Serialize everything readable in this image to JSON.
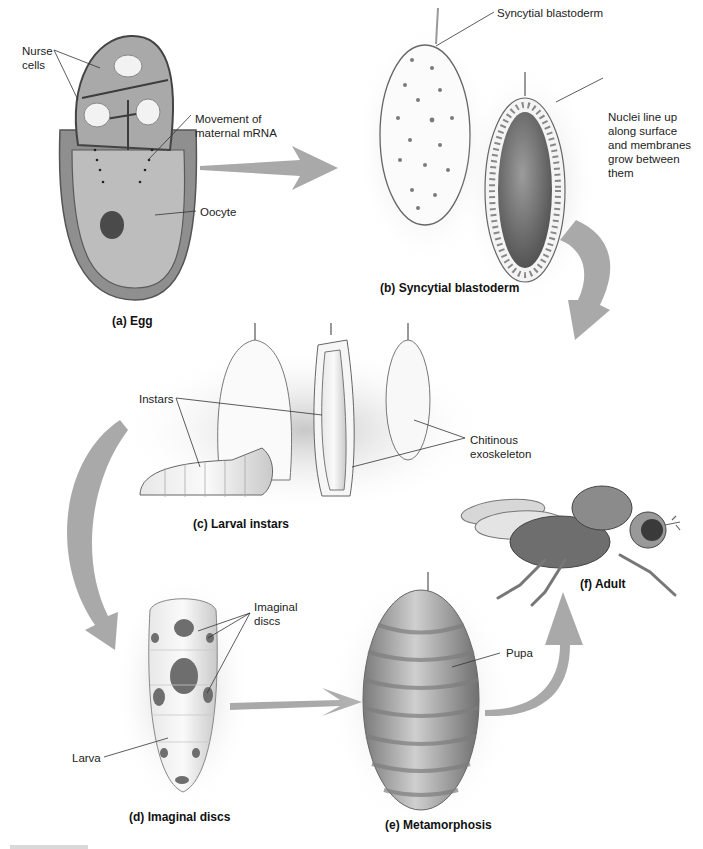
{
  "figure": {
    "panels": [
      {
        "id": "a",
        "caption": "(a) Egg",
        "labels": [
          "Nurse\ncells",
          "Movement of\nmaternal mRNA",
          "Oocyte"
        ]
      },
      {
        "id": "b",
        "caption": "(b) Syncytial blastoderm",
        "labels": [
          "Syncytial blastoderm",
          "Nuclei line up\nalong surface\nand membranes\ngrow between\nthem"
        ]
      },
      {
        "id": "c",
        "caption": "(c) Larval instars",
        "labels": [
          "Instars",
          "Chitinous\nexoskeleton"
        ]
      },
      {
        "id": "d",
        "caption": "(d) Imaginal discs",
        "labels": [
          "Imaginal\ndiscs",
          "Larva"
        ]
      },
      {
        "id": "e",
        "caption": "(e) Metamorphosis",
        "labels": [
          "Pupa"
        ]
      },
      {
        "id": "f",
        "caption": "(f) Adult",
        "labels": []
      }
    ],
    "colors": {
      "arrow": "#a9a9a9",
      "tissue_dark": "#6e6e6e",
      "tissue_mid": "#a3a3a3",
      "tissue_light": "#d6d6d6",
      "label_line": "#333333"
    }
  }
}
